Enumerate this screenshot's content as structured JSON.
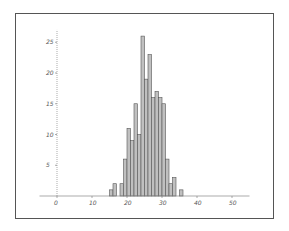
{
  "chart_data": {
    "type": "bar",
    "subtype": "histogram",
    "title": "",
    "xlabel": "",
    "ylabel": "",
    "xlim": [
      -5,
      55
    ],
    "ylim": [
      0,
      27
    ],
    "x_ticks": [
      0,
      10,
      20,
      30,
      40,
      50
    ],
    "y_ticks": [
      5,
      10,
      15,
      20,
      25
    ],
    "bin_width": 1,
    "categories": [
      15,
      16,
      17,
      18,
      19,
      20,
      21,
      22,
      23,
      24,
      25,
      26,
      27,
      28,
      29,
      30,
      31,
      32,
      33,
      34,
      35
    ],
    "values": [
      1,
      2,
      0,
      2,
      6,
      11,
      9,
      15,
      10,
      26,
      19,
      23,
      16,
      17,
      16,
      15,
      6,
      2,
      3,
      0,
      1
    ],
    "bar_color": "#c0c0c0",
    "bar_edge_color": "#555555",
    "grid": false,
    "legend": null
  }
}
